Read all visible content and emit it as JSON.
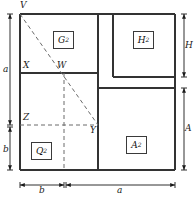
{
  "diagram": {
    "stroke_color": "#333333",
    "dash_color": "#6b6b6b",
    "background": "#ffffff",
    "outer_rect": {
      "x": 20,
      "y": 14,
      "width": 155,
      "height": 156
    },
    "vertices": [
      {
        "id": "V",
        "label": "V",
        "x": 20,
        "y": 14
      },
      {
        "id": "X",
        "label": "X",
        "x": 20,
        "y": 73
      },
      {
        "id": "W",
        "label": "W",
        "x": 64,
        "y": 73
      },
      {
        "id": "Z",
        "label": "Z",
        "x": 20,
        "y": 125
      },
      {
        "id": "Y",
        "label": "Y",
        "x": 98,
        "y": 125
      }
    ],
    "regions": [
      {
        "id": "G",
        "label": "G",
        "exponent": "2",
        "box": {
          "x": 53,
          "y": 31,
          "width": 21,
          "height": 18
        }
      },
      {
        "id": "H",
        "label": "H",
        "exponent": "2",
        "box": {
          "x": 133,
          "y": 31,
          "width": 21,
          "height": 18
        }
      },
      {
        "id": "Q",
        "label": "Q",
        "exponent": "2",
        "box": {
          "x": 31,
          "y": 142,
          "width": 21,
          "height": 18
        }
      },
      {
        "id": "A",
        "label": "A",
        "exponent": "2",
        "box": {
          "x": 126,
          "y": 136,
          "width": 21,
          "height": 18
        }
      }
    ],
    "dimensions": {
      "left": [
        {
          "label": "a",
          "from": 14,
          "to": 125,
          "x": 10
        },
        {
          "label": "b",
          "from": 127,
          "to": 170,
          "x": 10
        }
      ],
      "bottom": [
        {
          "label": "b",
          "from": 20,
          "to": 64,
          "y": 185
        },
        {
          "label": "a",
          "from": 66,
          "to": 175,
          "y": 185
        }
      ],
      "right": [
        {
          "label": "H",
          "from": 14,
          "to": 77,
          "x": 184
        },
        {
          "label": "A",
          "from": 88,
          "to": 170,
          "x": 184
        }
      ]
    },
    "lines": {
      "solid": [
        {
          "name": "outer-top",
          "x1": 20,
          "y1": 14,
          "x2": 175,
          "y2": 14
        },
        {
          "name": "outer-right",
          "x1": 175,
          "y1": 14,
          "x2": 175,
          "y2": 170
        },
        {
          "name": "outer-bottom",
          "x1": 20,
          "y1": 170,
          "x2": 175,
          "y2": 170
        },
        {
          "name": "outer-left",
          "x1": 20,
          "y1": 14,
          "x2": 20,
          "y2": 170
        },
        {
          "name": "divider-xw",
          "x1": 20,
          "y1": 73,
          "x2": 98,
          "y2": 73
        },
        {
          "name": "divider-vertical-main",
          "x1": 98,
          "y1": 14,
          "x2": 98,
          "y2": 170
        },
        {
          "name": "h-square-left",
          "x1": 113,
          "y1": 14,
          "x2": 113,
          "y2": 77
        },
        {
          "name": "h-square-bottom",
          "x1": 113,
          "y1": 77,
          "x2": 175,
          "y2": 77
        },
        {
          "name": "right-divider",
          "x1": 98,
          "y1": 88,
          "x2": 175,
          "y2": 88
        }
      ],
      "dashed": [
        {
          "name": "diagonal-v-to-y",
          "x1": 20,
          "y1": 14,
          "x2": 98,
          "y2": 125
        },
        {
          "name": "dash-z-to-y",
          "x1": 20,
          "y1": 125,
          "x2": 98,
          "y2": 125
        },
        {
          "name": "dash-w-vertical",
          "x1": 64,
          "y1": 73,
          "x2": 64,
          "y2": 170
        }
      ]
    }
  }
}
